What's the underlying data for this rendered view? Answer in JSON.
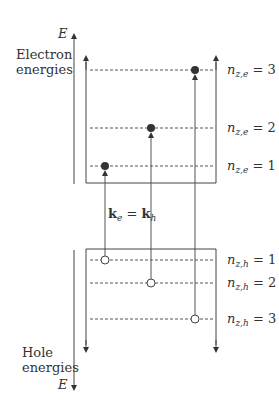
{
  "diagram": {
    "axis_label_top": "E",
    "axis_label_bottom": "E",
    "electron_label": [
      "Electron",
      "energies"
    ],
    "hole_label": [
      "Hole",
      "energies"
    ],
    "k_label": {
      "k1": "k",
      "sub1": "e",
      "eq": "=",
      "k2": "k",
      "sub2": "h"
    },
    "electron_levels": [
      {
        "n": "n",
        "sub": "z,e",
        "value": "= 3"
      },
      {
        "n": "n",
        "sub": "z,e",
        "value": "= 2"
      },
      {
        "n": "n",
        "sub": "z,e",
        "value": "= 1"
      }
    ],
    "hole_levels": [
      {
        "n": "n",
        "sub": "z,h",
        "value": "= 1"
      },
      {
        "n": "n",
        "sub": "z,h",
        "value": "= 2"
      },
      {
        "n": "n",
        "sub": "z,h",
        "value": "= 3"
      }
    ],
    "colors": {
      "line": "#444444",
      "dot": "#333333",
      "dash": "#555555"
    }
  }
}
